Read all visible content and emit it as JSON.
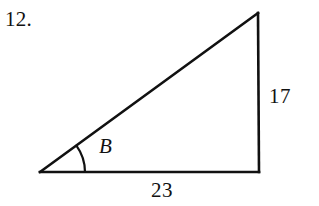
{
  "figure": {
    "problem_number": "12.",
    "background_color": "#ffffff",
    "stroke_color": "#111111",
    "width": 319,
    "height": 206,
    "shape": "right-triangle",
    "vertices": {
      "left": {
        "x": 40,
        "y": 172
      },
      "top_right": {
        "x": 258,
        "y": 13
      },
      "bottom_right": {
        "x": 259,
        "y": 172
      }
    },
    "stroke_width": 2.6,
    "angle_arc": {
      "label": "B",
      "center": {
        "x": 40,
        "y": 172
      },
      "radius": 45,
      "start_angle_deg": 0,
      "end_angle_deg": 36
    },
    "labels": {
      "opposite_side": "17",
      "adjacent_side": "23",
      "angle": "B"
    }
  }
}
